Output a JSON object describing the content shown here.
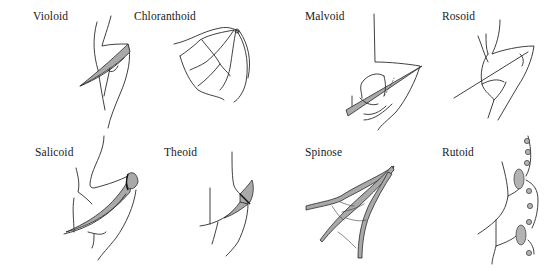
{
  "figure": {
    "type": "botanical tooth-type diagram",
    "fill_color": "#a9a9a9",
    "line_color": "#2a2a2a",
    "panels": [
      {
        "name": "violoid",
        "label": "Violoid",
        "row": 1,
        "col": 1
      },
      {
        "name": "chloranthoid",
        "label": "Chloranthoid",
        "row": 1,
        "col": 2
      },
      {
        "name": "malvoid",
        "label": "Malvoid",
        "row": 1,
        "col": 3
      },
      {
        "name": "rosoid",
        "label": "Rosoid",
        "row": 1,
        "col": 4
      },
      {
        "name": "salicoid",
        "label": "Salicoid",
        "row": 2,
        "col": 1
      },
      {
        "name": "theoid",
        "label": "Theoid",
        "row": 2,
        "col": 2
      },
      {
        "name": "spinose",
        "label": "Spinose",
        "row": 2,
        "col": 3
      },
      {
        "name": "rutoid",
        "label": "Rutoid",
        "row": 2,
        "col": 4
      }
    ]
  }
}
